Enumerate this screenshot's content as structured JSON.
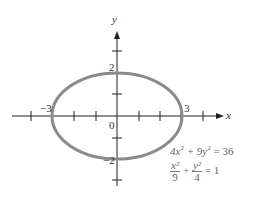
{
  "diagram": {
    "type": "ellipse-graph",
    "axes": {
      "x_label": "x",
      "y_label": "y"
    },
    "labels": {
      "origin": "0",
      "x_neg": "−3",
      "x_pos": "3",
      "y_pos": "2",
      "y_neg": "−2"
    },
    "ellipse": {
      "a": 3,
      "b": 2,
      "color": "#8a8a8a"
    },
    "equations": {
      "eq1": {
        "a": "4x",
        "b": "2",
        "c": " + 9y",
        "d": "2",
        "e": " = 36"
      },
      "eq2": {
        "xnum": "x²",
        "xden": "9",
        "plus": "+",
        "ynum": "y²",
        "yden": "4",
        "eq": "= 1"
      }
    }
  }
}
